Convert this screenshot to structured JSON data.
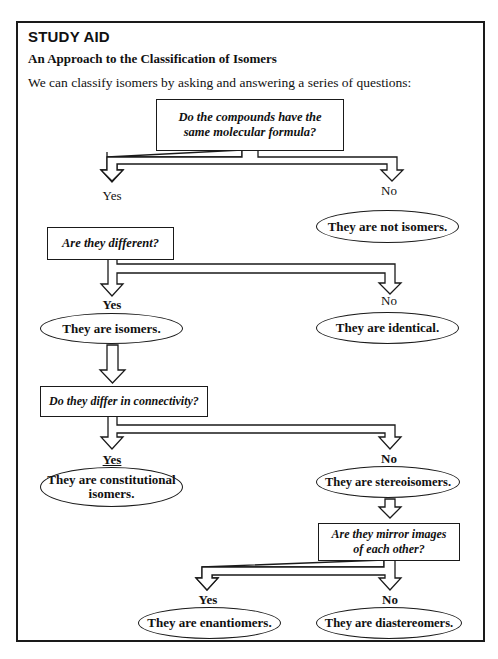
{
  "header": {
    "heading": "STUDY AID",
    "subtitle": "An Approach to the Classification of Isomers",
    "intro": "We can classify isomers by asking and answering a series of questions:"
  },
  "flowchart": {
    "questions": [
      {
        "id": "q1",
        "text": "Do the compounds have the same molecular formula?"
      },
      {
        "id": "q2",
        "text": "Are they different?"
      },
      {
        "id": "q3",
        "text": "Do they differ in connectivity?"
      },
      {
        "id": "q4",
        "text": "Are they mirror images of each other?"
      }
    ],
    "labels": {
      "yes": "Yes",
      "no": "No"
    },
    "outcomes": [
      {
        "id": "not-isomers",
        "text": "They are not isomers."
      },
      {
        "id": "isomers",
        "text": "They are isomers."
      },
      {
        "id": "identical",
        "text": "They are identical."
      },
      {
        "id": "constitutional",
        "text": "They are constitutional isomers."
      },
      {
        "id": "stereoisomers",
        "text": "They are stereoisomers."
      },
      {
        "id": "enantiomers",
        "text": "They are enantiomers."
      },
      {
        "id": "diastereomers",
        "text": "They are diastereomers."
      }
    ]
  }
}
